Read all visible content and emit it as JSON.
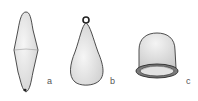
{
  "figure": {
    "items": [
      {
        "label": "a",
        "shape": "double-cone-sinker"
      },
      {
        "label": "b",
        "shape": "pear-sinker-with-eye"
      },
      {
        "label": "c",
        "shape": "bell-cup-sinker"
      }
    ],
    "colors": {
      "stroke": "#3a3a3a",
      "fill": "#ececec",
      "shade": "#cfcfcf",
      "background": "#ffffff"
    }
  }
}
